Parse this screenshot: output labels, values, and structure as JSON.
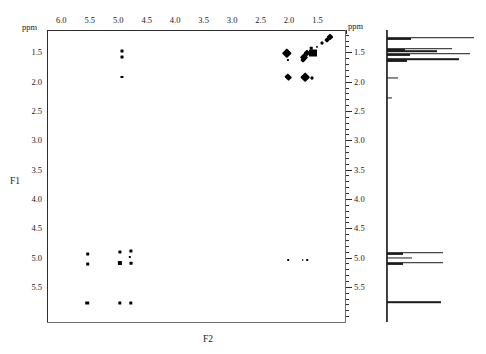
{
  "figure": {
    "type": "2d-nmr-cosy-spectrum",
    "x_axis_name": "F2",
    "y_axis_name": "F1",
    "unit_label_top_left": "ppm",
    "unit_label_top_right": "ppm",
    "unit_label_right_scale": "ppm"
  },
  "chart_data": {
    "type": "scatter",
    "title": "",
    "subtitle": "",
    "xlabel": "F2",
    "ylabel": "F1",
    "unit": "ppm",
    "grid": false,
    "legend": "none",
    "x_axis": {
      "label": "F2",
      "unit": "ppm",
      "direction": "reversed",
      "xlim": [
        6.25,
        1.0
      ],
      "major_ticks": [
        6.0,
        5.5,
        5.0,
        4.5,
        4.0,
        3.5,
        3.0,
        2.5,
        2.0,
        1.5
      ],
      "tick_labels": [
        "6.0",
        "5.5",
        "5.0",
        "4.5",
        "4.0",
        "3.5",
        "3.0",
        "2.5",
        "2.0",
        "1.5"
      ],
      "minor_tick_step": 0.1
    },
    "y_axis": {
      "label": "F1",
      "unit": "ppm",
      "direction": "reversed",
      "ylim": [
        1.12,
        6.1
      ],
      "major_ticks": [
        1.5,
        2.0,
        2.5,
        3.0,
        3.5,
        4.0,
        4.5,
        5.0,
        5.5
      ],
      "tick_labels": [
        "1.5",
        "2.0",
        "2.5",
        "3.0",
        "3.5",
        "4.0",
        "4.5",
        "5.0",
        "5.5"
      ],
      "minor_tick_step": 0.1
    },
    "right_scale": {
      "major_ticks": [
        1.5,
        2.0,
        2.5,
        3.0,
        3.5,
        4.0,
        4.5,
        5.0,
        5.5
      ],
      "tick_labels": [
        "1.5",
        "2.0",
        "2.5",
        "3.0",
        "3.5",
        "4.0",
        "4.5",
        "5.0",
        "5.5"
      ]
    },
    "peaks": [
      {
        "f2": 4.95,
        "f1": 1.46,
        "w": 3.0,
        "h": 3.0,
        "shape": "square"
      },
      {
        "f2": 4.95,
        "f1": 1.57,
        "w": 3.0,
        "h": 3.0,
        "shape": "square"
      },
      {
        "f2": 4.95,
        "f1": 1.9,
        "w": 3.2,
        "h": 2.0,
        "shape": "square"
      },
      {
        "f2": 1.3,
        "f1": 1.22,
        "w": 5.0,
        "h": 5.0,
        "shape": "diamond"
      },
      {
        "f2": 1.36,
        "f1": 1.27,
        "w": 4.0,
        "h": 4.0,
        "shape": "diamond"
      },
      {
        "f2": 1.44,
        "f1": 1.33,
        "w": 3.0,
        "h": 3.0,
        "shape": "diamond"
      },
      {
        "f2": 1.52,
        "f1": 1.39,
        "w": 2.2,
        "h": 2.2,
        "shape": "diamond"
      },
      {
        "f2": 1.6,
        "f1": 1.49,
        "w": 8.0,
        "h": 7.0,
        "shape": "square"
      },
      {
        "f2": 1.7,
        "f1": 1.5,
        "w": 5.0,
        "h": 5.0,
        "shape": "diamond"
      },
      {
        "f2": 1.76,
        "f1": 1.56,
        "w": 5.5,
        "h": 5.5,
        "shape": "diamond"
      },
      {
        "f2": 1.78,
        "f1": 1.62,
        "w": 4.0,
        "h": 4.0,
        "shape": "diamond"
      },
      {
        "f2": 1.63,
        "f1": 1.41,
        "w": 2.5,
        "h": 2.5,
        "shape": "square"
      },
      {
        "f2": 2.05,
        "f1": 1.49,
        "w": 7.0,
        "h": 6.5,
        "shape": "diamond"
      },
      {
        "f2": 2.04,
        "f1": 1.62,
        "w": 2.2,
        "h": 2.2,
        "shape": "square"
      },
      {
        "f2": 2.03,
        "f1": 1.9,
        "w": 5.5,
        "h": 5.0,
        "shape": "diamond"
      },
      {
        "f2": 1.62,
        "f1": 1.92,
        "w": 3.0,
        "h": 3.0,
        "shape": "diamond"
      },
      {
        "f2": 1.73,
        "f1": 1.9,
        "w": 6.5,
        "h": 7.0,
        "shape": "diamond"
      },
      {
        "f2": 5.55,
        "f1": 4.92,
        "w": 3.6,
        "h": 3.0,
        "shape": "square"
      },
      {
        "f2": 5.55,
        "f1": 5.09,
        "w": 3.6,
        "h": 3.0,
        "shape": "square"
      },
      {
        "f2": 4.98,
        "f1": 4.89,
        "w": 3.2,
        "h": 3.0,
        "shape": "square"
      },
      {
        "f2": 4.98,
        "f1": 5.07,
        "w": 4.2,
        "h": 4.0,
        "shape": "square"
      },
      {
        "f2": 4.8,
        "f1": 4.87,
        "w": 3.2,
        "h": 3.0,
        "shape": "square"
      },
      {
        "f2": 4.8,
        "f1": 5.08,
        "w": 3.0,
        "h": 2.6,
        "shape": "square"
      },
      {
        "f2": 4.81,
        "f1": 4.97,
        "w": 2.4,
        "h": 2.2,
        "shape": "square"
      },
      {
        "f2": 5.56,
        "f1": 5.76,
        "w": 3.6,
        "h": 3.2,
        "shape": "square"
      },
      {
        "f2": 4.99,
        "f1": 5.76,
        "w": 3.4,
        "h": 3.2,
        "shape": "square"
      },
      {
        "f2": 4.8,
        "f1": 5.76,
        "w": 3.4,
        "h": 3.2,
        "shape": "square"
      },
      {
        "f2": 2.03,
        "f1": 5.03,
        "w": 1.6,
        "h": 1.8,
        "shape": "square"
      },
      {
        "f2": 1.78,
        "f1": 5.03,
        "w": 1.6,
        "h": 1.8,
        "shape": "square"
      },
      {
        "f2": 1.7,
        "f1": 5.03,
        "w": 1.6,
        "h": 1.8,
        "shape": "square"
      }
    ],
    "projection_1d": {
      "description": "F1 trace projection plotted at right of 2D map",
      "peaks": [
        {
          "f1": 1.25,
          "intensity": 0.97
        },
        {
          "f1": 1.44,
          "intensity": 0.72
        },
        {
          "f1": 1.48,
          "intensity": 0.55
        },
        {
          "f1": 1.52,
          "intensity": 0.92
        },
        {
          "f1": 1.62,
          "intensity": 0.8
        },
        {
          "f1": 1.93,
          "intensity": 0.12
        },
        {
          "f1": 2.28,
          "intensity": 0.06
        },
        {
          "f1": 4.92,
          "intensity": 0.62
        },
        {
          "f1": 5.0,
          "intensity": 0.28
        },
        {
          "f1": 5.09,
          "intensity": 0.62
        },
        {
          "f1": 5.76,
          "intensity": 0.6
        }
      ]
    }
  }
}
